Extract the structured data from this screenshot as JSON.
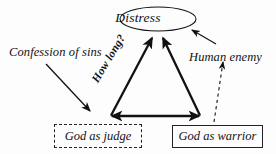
{
  "diagram": {
    "background_color": "#fdfdfd",
    "stroke_color": "#111111",
    "nodes": {
      "distress": {
        "label": "Distress",
        "shape": "ellipse",
        "border_style": "solid"
      },
      "confession_of_sins": {
        "label": "Confession of sins",
        "shape": "none",
        "border_style": "none"
      },
      "human_enemy": {
        "label": "Human enemy",
        "shape": "none",
        "border_style": "none"
      },
      "god_as_judge": {
        "label": "God as judge",
        "shape": "rectangle",
        "border_style": "dashed"
      },
      "god_as_warrior": {
        "label": "God as warrior",
        "shape": "rectangle",
        "border_style": "solid"
      }
    },
    "edge_labels": {
      "how_long": "How long?"
    },
    "edges": [
      {
        "from": "god_as_judge",
        "to": "distress",
        "style": "solid-thick",
        "arrow": "single",
        "label": "How long?"
      },
      {
        "from": "god_as_warrior",
        "to": "distress",
        "style": "solid-thick",
        "arrow": "single",
        "label": ""
      },
      {
        "from": "god_as_judge",
        "to": "god_as_warrior",
        "style": "solid-thick",
        "arrow": "double",
        "label": ""
      },
      {
        "from": "confession_of_sins",
        "to": "god_as_judge",
        "style": "solid-thin",
        "arrow": "single",
        "label": ""
      },
      {
        "from": "human_enemy",
        "to": "distress",
        "style": "solid-thin",
        "arrow": "single",
        "label": ""
      },
      {
        "from": "god_as_warrior",
        "to": "human_enemy",
        "style": "dashed-thin",
        "arrow": "single",
        "label": ""
      }
    ]
  }
}
